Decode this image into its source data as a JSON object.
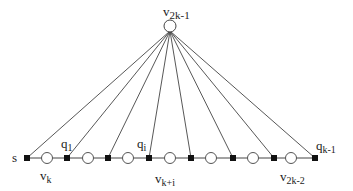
{
  "diagram": {
    "apex": {
      "label_main": "v",
      "label_sub": "2k-1",
      "x": 170,
      "y": 26
    },
    "baseline_y": 158,
    "squares": [
      27,
      67,
      108,
      149,
      191,
      233,
      274,
      315
    ],
    "circles": [
      47,
      88,
      128,
      170,
      211,
      253,
      291
    ],
    "labels": {
      "s": "s",
      "q1_main": "q",
      "q1_sub": "1",
      "qi_main": "q",
      "qi_sub": "i",
      "qk1_main": "q",
      "qk1_sub": "k-1",
      "vk_main": "v",
      "vk_sub": "k",
      "vki_main": "v",
      "vki_sub": "k+i",
      "v2k2_main": "v",
      "v2k2_sub": "2k-2"
    }
  }
}
